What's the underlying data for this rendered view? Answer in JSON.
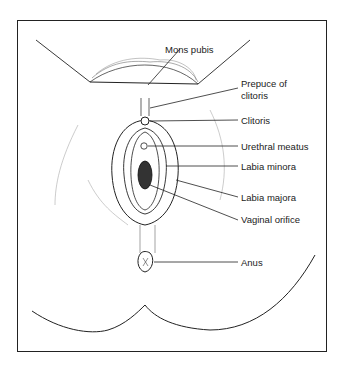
{
  "diagram": {
    "type": "anatomical-illustration",
    "labels": [
      {
        "id": "mons-pubis",
        "text": "Mons pubis",
        "x": 165,
        "y": 44
      },
      {
        "id": "prepuce-line1",
        "text": "Prepuce of",
        "x": 241,
        "y": 78
      },
      {
        "id": "prepuce-line2",
        "text": "clitoris",
        "x": 241,
        "y": 90
      },
      {
        "id": "clitoris",
        "text": "Clitoris",
        "x": 241,
        "y": 117
      },
      {
        "id": "urethral-meatus",
        "text": "Urethral meatus",
        "x": 241,
        "y": 140
      },
      {
        "id": "labia-minora",
        "text": "Labia minora",
        "x": 241,
        "y": 160
      },
      {
        "id": "labia-majora",
        "text": "Labia majora",
        "x": 241,
        "y": 191
      },
      {
        "id": "vaginal-orifice",
        "text": "Vaginal orifice",
        "x": 241,
        "y": 214
      },
      {
        "id": "anus",
        "text": "Anus",
        "x": 241,
        "y": 256
      }
    ]
  }
}
